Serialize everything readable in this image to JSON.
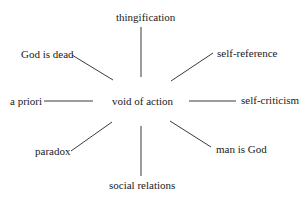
{
  "diagram": {
    "type": "radial concept map",
    "center": {
      "label": "void of action"
    },
    "nodes": [
      {
        "id": "top",
        "label": "thingification"
      },
      {
        "id": "top-left",
        "label": "God is dead"
      },
      {
        "id": "top-right",
        "label": "self-reference"
      },
      {
        "id": "left",
        "label": "a priori"
      },
      {
        "id": "right",
        "label": "self-criticism"
      },
      {
        "id": "bottom-left",
        "label": "paradox"
      },
      {
        "id": "bottom-right",
        "label": "man is God"
      },
      {
        "id": "bottom",
        "label": "social relations"
      }
    ],
    "edges": [
      {
        "from": "void of action",
        "to": "thingification"
      },
      {
        "from": "void of action",
        "to": "God is dead"
      },
      {
        "from": "void of action",
        "to": "self-reference"
      },
      {
        "from": "void of action",
        "to": "a priori"
      },
      {
        "from": "void of action",
        "to": "self-criticism"
      },
      {
        "from": "void of action",
        "to": "paradox"
      },
      {
        "from": "void of action",
        "to": "man is God"
      },
      {
        "from": "void of action",
        "to": "social relations"
      }
    ],
    "colors": {
      "text": "#1a1a1a",
      "line": "#3a3a3a",
      "background": "#ffffff"
    }
  }
}
